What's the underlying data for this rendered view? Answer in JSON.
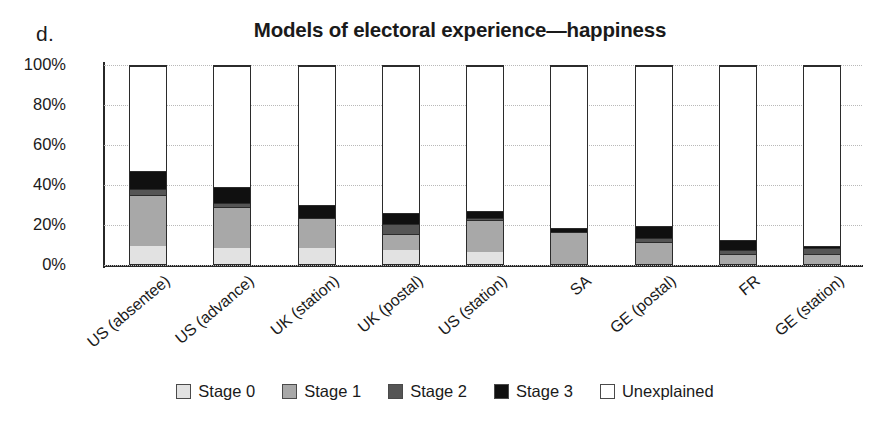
{
  "panel": {
    "letter": "d."
  },
  "chart_data": {
    "type": "bar",
    "subtype": "stacked-percent",
    "title": "Models of electoral experience—happiness",
    "xlabel": "",
    "ylabel": "",
    "ylim": [
      0,
      100
    ],
    "yticks": [
      "0%",
      "20%",
      "40%",
      "60%",
      "80%",
      "100%"
    ],
    "ytick_values": [
      0,
      20,
      40,
      60,
      80,
      100
    ],
    "grid": true,
    "grid_axis": "y",
    "legend_position": "bottom",
    "categories": [
      "US (absentee)",
      "US (advance)",
      "UK (station)",
      "UK (postal)",
      "US (station)",
      "SA",
      "GE (postal)",
      "FR",
      "GE (station)"
    ],
    "series": [
      {
        "name": "Stage 0",
        "color": "#e2e2e2",
        "values": [
          9,
          8,
          8,
          7,
          6,
          0,
          0,
          0,
          0
        ]
      },
      {
        "name": "Stage 1",
        "color": "#a8a8a8",
        "values": [
          26,
          21,
          15,
          8,
          16,
          16,
          11,
          5,
          5
        ]
      },
      {
        "name": "Stage 2",
        "color": "#555555",
        "values": [
          3,
          2,
          0,
          5,
          1,
          0,
          2,
          2,
          3
        ]
      },
      {
        "name": "Stage 3",
        "color": "#101010",
        "values": [
          9,
          8,
          7,
          6,
          4,
          2,
          6,
          5,
          1
        ]
      },
      {
        "name": "Unexplained",
        "color": "#ffffff",
        "values": [
          53,
          61,
          70,
          74,
          73,
          82,
          81,
          88,
          91
        ]
      }
    ],
    "totals_visible": [
      47,
      39,
      30,
      26,
      27,
      18,
      19,
      12,
      9
    ],
    "legend": [
      "Stage 0",
      "Stage 1",
      "Stage 2",
      "Stage 3",
      "Unexplained"
    ]
  }
}
